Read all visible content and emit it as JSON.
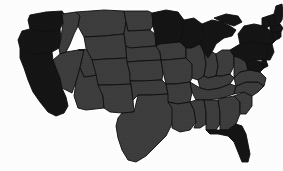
{
  "figure": {
    "background_color": "#fdfdfd",
    "border_color": "#0d0d0d",
    "width": 283,
    "height": 171
  },
  "legend": {
    "shown": false,
    "classes": [
      {
        "key": "dark",
        "label": "Dark shaded",
        "color": "#141414"
      },
      {
        "key": "gray",
        "label": "Gray shaded",
        "color": "#3c3c3c"
      }
    ]
  },
  "chart_data": {
    "type": "map",
    "subtitle": "",
    "xlabel": "",
    "ylabel": "",
    "projection": "contiguous-us",
    "grid": false,
    "legend_position": "none",
    "colors": {
      "dark": "#141414",
      "gray": "#3c3c3c",
      "background": "#fdfdfd",
      "border": "#0d0d0d"
    },
    "categories": [
      "Washington",
      "Oregon",
      "California",
      "Idaho",
      "Nevada",
      "Utah",
      "Arizona",
      "Montana",
      "Wyoming",
      "Colorado",
      "New Mexico",
      "North Dakota",
      "South Dakota",
      "Nebraska",
      "Kansas",
      "Oklahoma",
      "Texas",
      "Minnesota",
      "Iowa",
      "Missouri",
      "Arkansas",
      "Louisiana",
      "Wisconsin",
      "Illinois",
      "Michigan",
      "Indiana",
      "Ohio",
      "Kentucky",
      "Tennessee",
      "Mississippi",
      "Alabama",
      "Georgia",
      "Florida",
      "South Carolina",
      "North Carolina",
      "Virginia",
      "West Virginia",
      "Maryland",
      "Delaware",
      "Pennsylvania",
      "New Jersey",
      "New York",
      "Connecticut",
      "Rhode Island",
      "Massachusetts",
      "Vermont",
      "New Hampshire",
      "Maine"
    ],
    "values": [
      1,
      1,
      1,
      0,
      0,
      0,
      0,
      0,
      0,
      0,
      0,
      0,
      0,
      0,
      0,
      0,
      0,
      1,
      0,
      0,
      0,
      0,
      1,
      0,
      1,
      0,
      0,
      0,
      0,
      0,
      0,
      0,
      1,
      0,
      0,
      0,
      0,
      1,
      1,
      1,
      1,
      1,
      1,
      1,
      1,
      1,
      1,
      1
    ],
    "value_labels": {
      "0": "Gray shaded",
      "1": "Dark shaded"
    },
    "series": [
      {
        "name": "Shading class",
        "values": [
          "dark",
          "dark",
          "dark",
          "gray",
          "gray",
          "gray",
          "gray",
          "gray",
          "gray",
          "gray",
          "gray",
          "gray",
          "gray",
          "gray",
          "gray",
          "gray",
          "gray",
          "dark",
          "gray",
          "gray",
          "gray",
          "gray",
          "dark",
          "gray",
          "dark",
          "gray",
          "gray",
          "gray",
          "gray",
          "gray",
          "gray",
          "gray",
          "dark",
          "gray",
          "gray",
          "gray",
          "gray",
          "dark",
          "dark",
          "dark",
          "dark",
          "dark",
          "dark",
          "dark",
          "dark",
          "dark",
          "dark",
          "dark"
        ]
      }
    ]
  },
  "states": [
    {
      "id": "WA",
      "name": "Washington",
      "shade": "dark",
      "path": "M28,20 L30,15 L46,12 L62,11 L64,14 L63,23 L60,29 L52,31 L40,31 L30,29 Z"
    },
    {
      "id": "OR",
      "name": "Oregon",
      "shade": "dark",
      "path": "M22,31 L30,29 L40,31 L52,31 L60,29 L61,38 L59,48 L52,52 L40,54 L28,53 L20,48 L18,40 Z"
    },
    {
      "id": "CA",
      "name": "California",
      "shade": "dark",
      "path": "M20,48 L28,53 L40,54 L52,52 L53,60 L56,68 L60,78 L62,88 L66,97 L68,106 L64,113 L56,116 L48,112 L40,102 L33,92 L28,80 L24,68 L20,58 Z"
    },
    {
      "id": "ID",
      "name": "Idaho",
      "shade": "gray",
      "path": "M62,14 L76,12 L80,16 L78,26 L74,34 L70,44 L66,52 L60,54 L59,48 L61,38 L63,23 Z"
    },
    {
      "id": "NV",
      "name": "Nevada",
      "shade": "gray",
      "path": "M60,54 L66,52 L78,50 L84,50 L80,68 L76,82 L72,93 L62,88 L60,78 L56,68 L53,60 Z"
    },
    {
      "id": "UT",
      "name": "Utah",
      "shade": "gray",
      "path": "M78,50 L98,48 L100,62 L101,74 L92,76 L84,77 L80,68 L84,50 Z"
    },
    {
      "id": "AZ",
      "name": "Arizona",
      "shade": "gray",
      "path": "M80,68 L84,77 L92,76 L101,74 L103,96 L104,108 L86,110 L78,108 L74,96 L76,82 Z"
    },
    {
      "id": "MT",
      "name": "Montana",
      "shade": "gray",
      "path": "M76,12 L104,10 L124,11 L126,22 L124,34 L104,36 L84,37 L78,26 L80,16 Z"
    },
    {
      "id": "WY",
      "name": "Wyoming",
      "shade": "gray",
      "path": "M84,37 L104,36 L124,34 L126,50 L127,58 L106,59 L92,60 L86,48 Z"
    },
    {
      "id": "CO",
      "name": "Colorado",
      "shade": "gray",
      "path": "M92,60 L106,59 L127,58 L130,74 L131,84 L110,85 L98,85 L96,74 Z"
    },
    {
      "id": "NM",
      "name": "New Mexico",
      "shade": "gray",
      "path": "M98,85 L110,85 L131,84 L133,100 L134,112 L122,113 L110,112 L104,108 L103,96 Z"
    },
    {
      "id": "ND",
      "name": "North Dakota",
      "shade": "gray",
      "path": "M124,11 L148,11 L152,13 L153,26 L150,30 L128,31 L126,22 Z"
    },
    {
      "id": "SD",
      "name": "South Dakota",
      "shade": "gray",
      "path": "M126,22 L128,31 L150,30 L155,34 L156,46 L130,48 L126,46 L124,34 Z"
    },
    {
      "id": "NE",
      "name": "Nebraska",
      "shade": "gray",
      "path": "M126,46 L130,48 L156,46 L160,52 L161,60 L140,61 L127,62 L126,50 Z"
    },
    {
      "id": "KS",
      "name": "Kansas",
      "shade": "gray",
      "path": "M127,62 L140,61 L161,60 L163,72 L162,80 L140,81 L130,81 L130,74 Z"
    },
    {
      "id": "OK",
      "name": "Oklahoma",
      "shade": "gray",
      "path": "M130,81 L140,81 L162,80 L166,84 L168,94 L150,95 L138,95 L133,100 L131,84 Z"
    },
    {
      "id": "TX",
      "name": "Texas",
      "shade": "gray",
      "path": "M122,113 L134,112 L138,95 L150,95 L168,94 L172,100 L174,112 L172,124 L166,136 L156,146 L146,156 L136,162 L128,160 L122,150 L118,138 L116,126 L118,118 Z"
    },
    {
      "id": "MN",
      "name": "Minnesota",
      "shade": "dark",
      "path": "M152,13 L166,10 L178,12 L184,20 L183,32 L180,42 L160,44 L156,46 L155,34 L153,26 Z"
    },
    {
      "id": "IA",
      "name": "Iowa",
      "shade": "gray",
      "path": "M156,46 L160,44 L180,42 L186,48 L186,58 L166,60 L161,60 L160,52 Z"
    },
    {
      "id": "MO",
      "name": "Missouri",
      "shade": "gray",
      "path": "M161,60 L166,60 L186,58 L192,64 L194,74 L190,82 L176,84 L166,84 L163,72 Z"
    },
    {
      "id": "AR",
      "name": "Arkansas",
      "shade": "gray",
      "path": "M166,84 L176,84 L190,82 L192,92 L190,102 L178,104 L168,102 L168,94 Z"
    },
    {
      "id": "LA",
      "name": "Louisiana",
      "shade": "gray",
      "path": "M168,102 L178,104 L190,102 L194,110 L196,122 L190,130 L180,132 L172,128 L172,116 L172,108 Z"
    },
    {
      "id": "WI",
      "name": "Wisconsin",
      "shade": "dark",
      "path": "M180,42 L183,32 L184,20 L194,18 L202,24 L204,34 L200,44 L192,48 L186,48 Z"
    },
    {
      "id": "IL",
      "name": "Illinois",
      "shade": "gray",
      "path": "M186,48 L192,48 L200,44 L204,52 L206,64 L204,76 L198,80 L192,78 L192,64 L186,58 Z"
    },
    {
      "id": "MI",
      "name": "Michigan",
      "shade": "dark",
      "path": "M204,34 L202,24 L212,20 L222,22 L230,26 L236,30 L232,36 L224,38 L216,44 L212,52 L208,58 L204,52 L200,44 Z M214,18 L226,14 L238,16 L242,22 L234,26 L222,22 Z"
    },
    {
      "id": "IN",
      "name": "Indiana",
      "shade": "gray",
      "path": "M204,52 L208,58 L212,52 L216,54 L218,66 L216,76 L208,78 L204,76 L206,64 Z"
    },
    {
      "id": "OH",
      "name": "Ohio",
      "shade": "gray",
      "path": "M216,54 L222,50 L230,50 L234,56 L234,66 L230,74 L222,76 L216,76 L218,66 Z"
    },
    {
      "id": "KY",
      "name": "Kentucky",
      "shade": "gray",
      "path": "M198,80 L204,76 L208,78 L216,76 L222,76 L230,74 L234,78 L230,84 L220,88 L208,90 L200,88 Z"
    },
    {
      "id": "TN",
      "name": "Tennessee",
      "shade": "gray",
      "path": "M190,82 L200,88 L208,90 L220,88 L230,84 L236,86 L234,94 L222,98 L208,100 L196,100 L192,92 Z"
    },
    {
      "id": "MS",
      "name": "Mississippi",
      "shade": "gray",
      "path": "M190,102 L196,100 L204,100 L206,112 L206,124 L200,128 L194,128 L196,122 L194,110 Z"
    },
    {
      "id": "AL",
      "name": "Alabama",
      "shade": "gray",
      "path": "M204,100 L208,100 L218,100 L220,112 L220,124 L216,130 L206,130 L206,124 L206,112 Z"
    },
    {
      "id": "GA",
      "name": "Georgia",
      "shade": "gray",
      "path": "M218,100 L222,98 L234,96 L240,102 L240,114 L236,124 L228,130 L220,130 L220,124 L220,112 Z"
    },
    {
      "id": "FL",
      "name": "Florida",
      "shade": "dark",
      "path": "M216,130 L228,130 L236,124 L242,126 L246,134 L248,144 L250,154 L248,162 L242,162 L238,152 L234,142 L228,136 L218,134 L210,134 L206,130 Z"
    },
    {
      "id": "SC",
      "name": "South Carolina",
      "shade": "gray",
      "path": "M234,96 L244,92 L252,96 L252,106 L246,114 L240,114 L240,102 Z"
    },
    {
      "id": "NC",
      "name": "North Carolina",
      "shade": "gray",
      "path": "M234,94 L236,86 L246,82 L258,82 L264,86 L258,92 L252,96 L244,92 Z"
    },
    {
      "id": "VA",
      "name": "Virginia",
      "shade": "gray",
      "path": "M234,78 L240,72 L250,70 L260,72 L266,78 L264,86 L258,82 L246,82 L236,86 Z"
    },
    {
      "id": "WV",
      "name": "West Virginia",
      "shade": "gray",
      "path": "M234,56 L240,58 L246,62 L248,70 L240,72 L234,78 L234,66 Z"
    },
    {
      "id": "MD",
      "name": "Maryland",
      "shade": "dark",
      "path": "M246,62 L254,60 L262,62 L266,66 L260,72 L250,70 L248,70 Z"
    },
    {
      "id": "DE",
      "name": "Delaware",
      "shade": "dark",
      "path": "M262,60 L266,60 L268,66 L264,68 L262,64 Z"
    },
    {
      "id": "PA",
      "name": "Pennsylvania",
      "shade": "dark",
      "path": "M230,50 L240,44 L254,42 L266,44 L268,52 L266,60 L254,60 L246,62 L240,58 L234,56 Z"
    },
    {
      "id": "NJ",
      "name": "New Jersey",
      "shade": "dark",
      "path": "M266,44 L272,44 L274,52 L270,60 L266,60 L268,52 Z"
    },
    {
      "id": "NY",
      "name": "New York",
      "shade": "dark",
      "path": "M240,44 L238,34 L244,26 L254,24 L264,26 L272,32 L276,40 L272,44 L266,44 L254,42 Z"
    },
    {
      "id": "CT",
      "name": "Connecticut",
      "shade": "dark",
      "path": "M272,32 L278,32 L280,38 L276,40 L272,38 Z"
    },
    {
      "id": "RI",
      "name": "Rhode Island",
      "shade": "dark",
      "path": "M278,32 L281,32 L281,37 L279,37 Z"
    },
    {
      "id": "MA",
      "name": "Massachusetts",
      "shade": "dark",
      "path": "M270,26 L280,24 L283,28 L281,32 L272,32 L270,30 Z"
    },
    {
      "id": "VT",
      "name": "Vermont",
      "shade": "dark",
      "path": "M262,18 L268,16 L270,26 L266,28 L262,26 Z"
    },
    {
      "id": "NH",
      "name": "New Hampshire",
      "shade": "dark",
      "path": "M268,16 L274,14 L276,24 L272,28 L270,26 Z"
    },
    {
      "id": "ME",
      "name": "Maine",
      "shade": "dark",
      "path": "M274,14 L276,6 L282,4 L283,12 L282,20 L278,26 L276,24 Z"
    }
  ]
}
